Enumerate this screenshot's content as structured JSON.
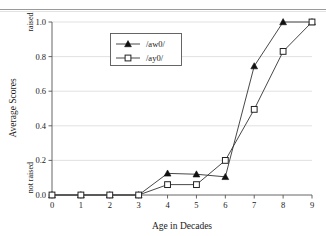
{
  "figure": {
    "has_top_rule": true,
    "background_color": "#ffffff",
    "line_color": "#333333",
    "grid_color": "#d9d9d9",
    "axis_color": "#555555"
  },
  "chart_data": {
    "type": "line",
    "title": "",
    "xlabel": "Age in Decades",
    "ylabel": "Average Scores",
    "x": [
      0,
      1,
      2,
      3,
      4,
      5,
      6,
      7,
      8,
      9
    ],
    "xtick_labels": [
      "0",
      "1",
      "2",
      "3",
      "4",
      "5",
      "6",
      "7",
      "8",
      "9"
    ],
    "xlim": [
      0,
      9
    ],
    "ylim": [
      0.0,
      1.0
    ],
    "ytick_values": [
      0.0,
      0.2,
      0.4,
      0.6,
      0.8,
      1.0
    ],
    "ytick_labels": [
      "0.0",
      "0.2",
      "0.4",
      "0.6",
      "0.8",
      "1.0"
    ],
    "grid": true,
    "grid_axis": "y",
    "legend_position": "upper left",
    "annotations": [
      {
        "text": "raised",
        "axis": "y",
        "value": 1.0
      },
      {
        "text": "not raised",
        "axis": "y",
        "value": 0.1
      }
    ],
    "series": [
      {
        "name": "/aw0/",
        "marker": "filled-triangle",
        "values": [
          0.0,
          0.0,
          0.0,
          0.0,
          0.125,
          0.12,
          0.105,
          0.745,
          1.0,
          1.0
        ]
      },
      {
        "name": "/ay0/",
        "marker": "open-square",
        "values": [
          0.0,
          0.0,
          0.0,
          0.0,
          0.06,
          0.06,
          0.2,
          0.495,
          0.83,
          1.0
        ]
      }
    ]
  }
}
